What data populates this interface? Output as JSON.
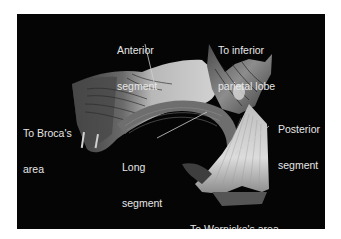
{
  "figure": {
    "background_color": "#050505",
    "label_color": "#e6e6e6",
    "labels": {
      "anterior_segment": {
        "line1": "Anterior",
        "line2": "segment"
      },
      "inferior_parietal": {
        "line1": "To inferior",
        "line2": "parietal lobe"
      },
      "broca": {
        "line1": "To Broca's",
        "line2": "area"
      },
      "posterior_segment": {
        "line1": "Posterior",
        "line2": "segment"
      },
      "long_segment": {
        "line1": "Long",
        "line2": "segment"
      },
      "wernicke": {
        "line1": "To Wernicke's area"
      }
    }
  }
}
